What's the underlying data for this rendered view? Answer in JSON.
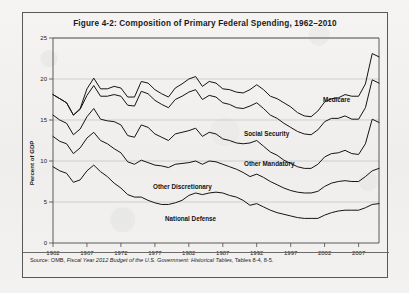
{
  "figure": {
    "title": "Figure 4-2: Composition of Primary Federal Spending, 1962–2010",
    "source_prefix": "Source: OMB, ",
    "source_italic": "Fiscal Year 2012 Budget of the U.S. Government: Historical Tables",
    "source_suffix": ", Tables 8-4, 8-5."
  },
  "chart_data": {
    "type": "line",
    "title": "Figure 4-2: Composition of Primary Federal Spending, 1962–2010",
    "xlabel": "",
    "ylabel": "Percent of GDP",
    "xlim": [
      1962,
      2010
    ],
    "ylim": [
      0,
      25
    ],
    "yticks": [
      0,
      5,
      10,
      15,
      20,
      25
    ],
    "xticks": [
      1962,
      1967,
      1972,
      1977,
      1982,
      1987,
      1992,
      1997,
      2002,
      2007
    ],
    "grid": true,
    "legend_position": "inline-labels",
    "stacked": true,
    "note": "Lines are cumulative totals: National Defense, then +Other Discretionary, then +Other Mandatory, then +Social Security, then +Medicare.",
    "x": [
      1962,
      1963,
      1964,
      1965,
      1966,
      1967,
      1968,
      1969,
      1970,
      1971,
      1972,
      1973,
      1974,
      1975,
      1976,
      1977,
      1978,
      1979,
      1980,
      1981,
      1982,
      1983,
      1984,
      1985,
      1986,
      1987,
      1988,
      1989,
      1990,
      1991,
      1992,
      1993,
      1994,
      1995,
      1996,
      1997,
      1998,
      1999,
      2000,
      2001,
      2002,
      2003,
      2004,
      2005,
      2006,
      2007,
      2008,
      2009,
      2010
    ],
    "series": [
      {
        "name": "National Defense",
        "label": "National Defense",
        "values": [
          9.3,
          8.8,
          8.5,
          7.4,
          7.7,
          8.8,
          9.5,
          8.7,
          8.1,
          7.3,
          6.7,
          5.9,
          5.6,
          5.6,
          5.2,
          4.9,
          4.7,
          4.7,
          4.9,
          5.2,
          5.8,
          6.1,
          5.9,
          6.1,
          6.2,
          6.1,
          5.8,
          5.6,
          5.2,
          4.6,
          4.8,
          4.4,
          4.0,
          3.7,
          3.5,
          3.3,
          3.1,
          3.0,
          3.0,
          3.0,
          3.4,
          3.7,
          3.9,
          4.0,
          4.0,
          4.0,
          4.3,
          4.7,
          4.8
        ]
      },
      {
        "name": "Other Discretionary",
        "label": "Other Discretionary",
        "values": [
          3.7,
          3.6,
          3.6,
          3.5,
          3.9,
          4.0,
          4.0,
          3.8,
          4.0,
          4.2,
          4.3,
          4.0,
          4.0,
          4.5,
          4.6,
          4.6,
          4.7,
          4.5,
          4.7,
          4.5,
          4.0,
          3.9,
          3.7,
          3.9,
          3.7,
          3.5,
          3.5,
          3.4,
          3.4,
          3.5,
          3.6,
          3.6,
          3.5,
          3.4,
          3.2,
          3.1,
          3.1,
          3.1,
          3.1,
          3.3,
          3.5,
          3.6,
          3.6,
          3.6,
          3.5,
          3.5,
          3.8,
          4.1,
          4.3
        ]
      },
      {
        "name": "Other Mandatory",
        "label": "Other Mandatory",
        "values": [
          2.6,
          2.6,
          2.5,
          2.3,
          2.3,
          2.6,
          2.9,
          2.6,
          2.8,
          3.3,
          3.4,
          3.2,
          3.3,
          4.3,
          4.3,
          3.8,
          3.5,
          3.3,
          3.7,
          3.8,
          3.9,
          4.0,
          3.4,
          3.5,
          3.4,
          3.1,
          3.2,
          3.2,
          3.5,
          4.1,
          4.1,
          3.8,
          3.6,
          3.6,
          3.4,
          3.3,
          3.1,
          3.0,
          3.0,
          3.3,
          3.6,
          3.6,
          3.5,
          3.7,
          3.4,
          3.3,
          4.0,
          6.3,
          5.6
        ]
      },
      {
        "name": "Social Security",
        "label": "Social Security",
        "values": [
          2.5,
          2.6,
          2.5,
          2.4,
          2.4,
          2.6,
          2.8,
          2.8,
          3.0,
          3.3,
          3.5,
          3.7,
          3.8,
          4.1,
          4.1,
          4.1,
          4.0,
          4.0,
          4.2,
          4.4,
          4.7,
          4.7,
          4.5,
          4.5,
          4.5,
          4.4,
          4.4,
          4.3,
          4.3,
          4.5,
          4.6,
          4.6,
          4.5,
          4.5,
          4.5,
          4.4,
          4.3,
          4.2,
          4.1,
          4.2,
          4.3,
          4.3,
          4.2,
          4.2,
          4.2,
          4.3,
          4.4,
          4.8,
          4.8
        ]
      },
      {
        "name": "Medicare",
        "label": "Medicare",
        "values": [
          0.0,
          0.0,
          0.0,
          0.0,
          0.1,
          0.8,
          0.9,
          0.9,
          0.9,
          1.0,
          1.0,
          1.0,
          1.1,
          1.2,
          1.3,
          1.3,
          1.3,
          1.3,
          1.4,
          1.5,
          1.6,
          1.6,
          1.6,
          1.7,
          1.7,
          1.7,
          1.8,
          1.9,
          1.9,
          2.0,
          2.2,
          2.3,
          2.3,
          2.4,
          2.5,
          2.5,
          2.3,
          2.2,
          2.2,
          2.3,
          2.4,
          2.4,
          2.5,
          2.6,
          2.8,
          2.8,
          2.9,
          3.2,
          3.2
        ]
      }
    ],
    "cumulative_top_values": [
      18.1,
      17.6,
      17.1,
      15.6,
      16.4,
      18.8,
      20.1,
      18.8,
      18.8,
      19.1,
      18.9,
      17.8,
      17.8,
      19.7,
      19.5,
      18.7,
      18.2,
      17.8,
      18.9,
      19.4,
      20.0,
      20.3,
      19.1,
      19.7,
      19.5,
      18.8,
      18.7,
      18.4,
      18.3,
      18.7,
      19.3,
      18.7,
      17.9,
      17.6,
      17.1,
      16.6,
      15.9,
      15.5,
      15.4,
      16.1,
      17.2,
      17.6,
      17.7,
      18.1,
      17.9,
      17.9,
      19.4,
      23.1,
      22.7
    ]
  },
  "axis": {
    "y_title": "Percent of GDP",
    "y_ticks": [
      "0",
      "5",
      "10",
      "15",
      "20",
      "25"
    ],
    "x_ticks": [
      "1962",
      "1967",
      "1972",
      "1977",
      "1982",
      "1987",
      "1992",
      "1997",
      "2002",
      "2007"
    ]
  },
  "labels": {
    "medicare": "Medicare",
    "social_security": "Social Security",
    "other_mandatory": "Other Mandatory",
    "other_discretionary": "Other Discretionary",
    "national_defense": "National Defense"
  }
}
